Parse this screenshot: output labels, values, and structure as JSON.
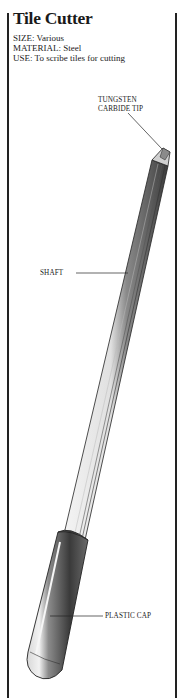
{
  "title": "Tile Cutter",
  "specs": [
    {
      "key": "SIZE",
      "value": "Various",
      "text": "SIZE: Various"
    },
    {
      "key": "MATERIAL",
      "value": "Steel",
      "text": "MATERIAL: Steel"
    },
    {
      "key": "USE",
      "value": "To scribe tiles for cutting",
      "text": "USE: To scribe tiles for cutting"
    }
  ],
  "labels": {
    "tip_line1": "TUNGSTEN",
    "tip_line2": "CARBIDE TIP",
    "shaft": "SHAFT",
    "cap": "PLASTIC CAP"
  },
  "colors": {
    "ink": "#1a1a1a",
    "background": "#ffffff",
    "shaft_dark": "#4a4a4a",
    "shaft_light": "#e8e8e8"
  }
}
